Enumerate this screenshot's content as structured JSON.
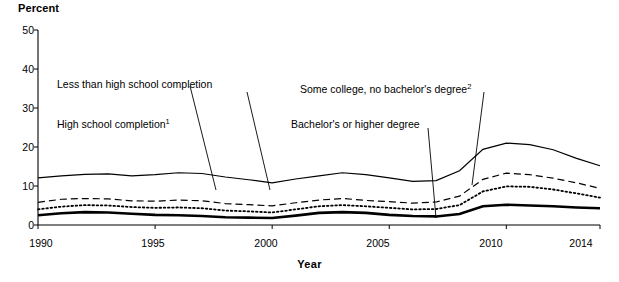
{
  "chart_data": {
    "type": "line",
    "title": "",
    "xlabel": "Year",
    "ylabel": "Percent",
    "xlim": [
      1990,
      2014
    ],
    "ylim": [
      0,
      50
    ],
    "ytick_labels": [
      "0",
      "10",
      "20",
      "30",
      "40",
      "50"
    ],
    "ytick_values": [
      0,
      10,
      20,
      30,
      40,
      50
    ],
    "xtick_labels": [
      "1990",
      "1995",
      "2000",
      "2005",
      "2010",
      "2014"
    ],
    "xtick_values": [
      1990,
      1995,
      2000,
      2005,
      2010,
      2014
    ],
    "grid": false,
    "legend_position": "inline-annotations",
    "x": [
      1990,
      1991,
      1992,
      1993,
      1994,
      1995,
      1996,
      1997,
      1998,
      1999,
      2000,
      2001,
      2002,
      2003,
      2004,
      2005,
      2006,
      2007,
      2008,
      2009,
      2010,
      2011,
      2012,
      2013,
      2014
    ],
    "series": [
      {
        "name": "Less than high school completion",
        "style": "thin-solid",
        "values": [
          12.1,
          12.6,
          13.0,
          13.1,
          12.6,
          12.9,
          13.4,
          13.2,
          12.3,
          11.6,
          10.8,
          11.8,
          12.6,
          13.4,
          12.9,
          12.1,
          11.2,
          11.4,
          13.9,
          19.4,
          21.0,
          20.6,
          19.3,
          17.1,
          15.2
        ]
      },
      {
        "name": "High school completion",
        "style": "dashed",
        "footnote": "1",
        "values": [
          5.8,
          6.6,
          6.8,
          6.7,
          6.2,
          6.1,
          6.4,
          6.2,
          5.5,
          5.2,
          4.9,
          5.7,
          6.4,
          6.8,
          6.3,
          6.0,
          5.6,
          5.9,
          7.4,
          11.7,
          13.3,
          12.9,
          12.0,
          10.8,
          9.4
        ]
      },
      {
        "name": "Some college, no bachelor's degree",
        "style": "dotted",
        "footnote": "2",
        "values": [
          4.0,
          4.7,
          5.1,
          5.0,
          4.6,
          4.4,
          4.5,
          4.3,
          3.7,
          3.5,
          3.2,
          4.0,
          4.8,
          5.1,
          4.8,
          4.4,
          4.0,
          4.1,
          5.1,
          8.6,
          9.9,
          9.8,
          9.1,
          8.1,
          7.0
        ]
      },
      {
        "name": "Bachelor's or higher degree",
        "style": "thick-solid",
        "values": [
          2.5,
          3.0,
          3.3,
          3.2,
          2.9,
          2.6,
          2.5,
          2.3,
          2.0,
          1.9,
          1.8,
          2.4,
          3.1,
          3.3,
          3.1,
          2.6,
          2.3,
          2.2,
          2.8,
          4.8,
          5.2,
          5.0,
          4.8,
          4.5,
          4.3
        ]
      }
    ],
    "annotations": [
      {
        "text": "Less than high school completion",
        "x_px": 57,
        "y_px": 78
      },
      {
        "text": "High school completion",
        "x_px": 57,
        "y_px": 118,
        "footnote": "1"
      },
      {
        "text": "Some college, no bachelor's degree",
        "x_px": 300,
        "y_px": 83,
        "footnote": "2"
      },
      {
        "text": "Bachelor's or higher degree",
        "x_px": 291,
        "y_px": 118
      }
    ]
  },
  "axes": {
    "percent_label": "Percent",
    "year_label": "Year"
  }
}
